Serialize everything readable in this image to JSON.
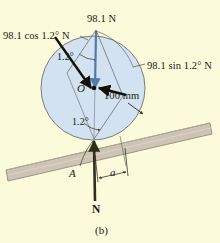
{
  "figure": {
    "caption": "(b)",
    "background_color": "#fbfadb",
    "labels": {
      "weight_force": "98.1 N",
      "cos_component": "98.1 cos 1.2° N",
      "sin_component": "98.1 sin 1.2° N",
      "angle_upper": "1.2°",
      "angle_lower": "1.2°",
      "center_point": "O",
      "radius_dimension": "100 mm",
      "contact_point": "A",
      "offset_dimension": "a",
      "normal_force": "N"
    },
    "colors": {
      "background": "#fbfadb",
      "wheel_fill": "#d3e2f0",
      "wheel_stroke": "#6d6f70",
      "plank_fill": "#cdc4b6",
      "plank_stroke": "#7d7567",
      "weight_arrow": "#5479ad",
      "component_arrow": "#111108",
      "normal_arrow": "#2f2e18",
      "leader_line": "#4a4a3a",
      "text": "#1a1a14"
    },
    "geometry": {
      "wheel_center_x": 93,
      "wheel_center_y": 88,
      "wheel_radius": 52,
      "contact_point_x": 94,
      "contact_point_y": 139,
      "apex_x": 96,
      "apex_y": 30,
      "tilt_degrees": 1.2,
      "plank_angle_degrees": -13
    }
  }
}
